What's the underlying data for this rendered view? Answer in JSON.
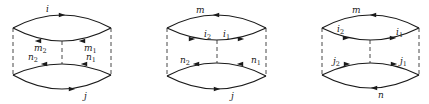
{
  "figure": {
    "diagrams": [
      {
        "id": "diagram-1",
        "bounds": {
          "left": 13,
          "right": 111,
          "top_y": 28,
          "bottom_y": 75,
          "mid_x": 62
        },
        "outer_top": {
          "label": "i",
          "label_pos": [
            46,
            12
          ],
          "arrow": {
            "x": 62,
            "y": 15,
            "dir": "right"
          },
          "peak": 15
        },
        "inner_top": {
          "labels": [
            {
              "base": "m",
              "sub": "2",
              "pos": [
                34,
                51
              ]
            },
            {
              "base": "m",
              "sub": "1",
              "pos": [
                84,
                51
              ]
            }
          ],
          "arrows": [
            {
              "x": 38,
              "y": 41,
              "dir": "left"
            },
            {
              "x": 82,
              "y": 41,
              "dir": "left"
            }
          ],
          "trough": 41
        },
        "inner_bottom": {
          "labels": [
            {
              "base": "n",
              "sub": "2",
              "pos": [
                28,
                60
              ]
            },
            {
              "base": "n",
              "sub": "1",
              "pos": [
                86,
                60
              ]
            }
          ],
          "arrows": [
            {
              "x": 44,
              "y": 64,
              "dir": "left"
            },
            {
              "x": 84,
              "y": 64,
              "dir": "left"
            }
          ],
          "peak": 64
        },
        "outer_bottom": {
          "label": "j",
          "label_pos": [
            84,
            99
          ],
          "arrow": {
            "x": 72,
            "y": 89,
            "dir": "right"
          },
          "trough": 89
        }
      },
      {
        "id": "diagram-2",
        "bounds": {
          "left": 167,
          "right": 266,
          "top_y": 28,
          "bottom_y": 76,
          "mid_x": 217
        },
        "outer_top": {
          "label": "m",
          "label_pos": [
            196,
            13
          ],
          "arrow": {
            "x": 216,
            "y": 15,
            "dir": "left"
          },
          "peak": 15
        },
        "inner_top": {
          "labels": [
            {
              "base": "i",
              "sub": "2",
              "pos": [
                204,
                37
              ]
            },
            {
              "base": "i",
              "sub": "1",
              "pos": [
                223,
                37
              ]
            }
          ],
          "arrows": [
            {
              "x": 192,
              "y": 39,
              "dir": "right"
            },
            {
              "x": 241,
              "y": 39,
              "dir": "right"
            }
          ],
          "trough": 40
        },
        "inner_bottom": {
          "labels": [
            {
              "base": "n",
              "sub": "2",
              "pos": [
                180,
                63
              ]
            },
            {
              "base": "n",
              "sub": "1",
              "pos": [
                251,
                63
              ]
            }
          ],
          "arrows": [
            {
              "x": 196,
              "y": 64,
              "dir": "left"
            },
            {
              "x": 240,
              "y": 64,
              "dir": "left"
            }
          ],
          "peak": 63
        },
        "outer_bottom": {
          "label": "j",
          "label_pos": [
            231,
            99
          ],
          "arrow": {
            "x": 217,
            "y": 89,
            "dir": "right"
          },
          "trough": 89
        }
      },
      {
        "id": "diagram-3",
        "bounds": {
          "left": 322,
          "right": 419,
          "top_y": 28,
          "bottom_y": 75,
          "mid_x": 370
        },
        "outer_top": {
          "label": "m",
          "label_pos": [
            352,
            13
          ],
          "arrow": {
            "x": 373,
            "y": 15,
            "dir": "left"
          },
          "peak": 15
        },
        "inner_top": {
          "labels": [
            {
              "base": "i",
              "sub": "2",
              "pos": [
                337,
                32
              ]
            },
            {
              "base": "i",
              "sub": "1",
              "pos": [
                396,
                35
              ]
            }
          ],
          "arrows": [
            {
              "x": 346,
              "y": 38,
              "dir": "right"
            },
            {
              "x": 393,
              "y": 38,
              "dir": "right"
            }
          ],
          "trough": 40
        },
        "inner_bottom": {
          "labels": [
            {
              "base": "j",
              "sub": "2",
              "pos": [
                333,
                64
              ]
            },
            {
              "base": "j",
              "sub": "1",
              "pos": [
                400,
                64
              ]
            }
          ],
          "arrows": [
            {
              "x": 347,
              "y": 64,
              "dir": "right"
            },
            {
              "x": 394,
              "y": 64,
              "dir": "right"
            }
          ],
          "peak": 63
        },
        "outer_bottom": {
          "label": "n",
          "label_pos": [
            378,
            98
          ],
          "arrow": {
            "x": 374,
            "y": 88,
            "dir": "left"
          },
          "trough": 88
        }
      }
    ]
  }
}
